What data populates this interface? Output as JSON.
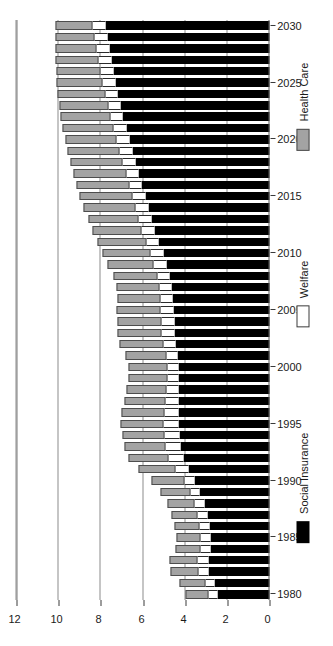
{
  "chart_data": {
    "type": "bar",
    "orientation": "rotated-90-ccw",
    "stacked": true,
    "title": "",
    "xlabel": "",
    "ylabel": "",
    "ylim": [
      0,
      12
    ],
    "ytick_values": [
      0,
      2,
      4,
      6,
      8,
      10,
      12
    ],
    "ytick_labels": [
      "0",
      "2",
      "4",
      "6",
      "8",
      "10",
      "12"
    ],
    "grid": true,
    "legend_position": "right",
    "categories": [
      "1980",
      "1981",
      "1982",
      "1983",
      "1984",
      "1985",
      "1986",
      "1987",
      "1988",
      "1989",
      "1990",
      "1991",
      "1992",
      "1993",
      "1994",
      "1995",
      "1996",
      "1997",
      "1998",
      "1999",
      "2000",
      "2001",
      "2002",
      "2003",
      "2004",
      "2005",
      "2006",
      "2007",
      "2008",
      "2009",
      "2010",
      "2011",
      "2012",
      "2013",
      "2014",
      "2015",
      "2016",
      "2017",
      "2018",
      "2019",
      "2020",
      "2021",
      "2022",
      "2023",
      "2024",
      "2025",
      "2026",
      "2027",
      "2028",
      "2029",
      "2030"
    ],
    "xtick_labels": [
      "1980",
      "1985",
      "1990",
      "1995",
      "2000",
      "2005",
      "2010",
      "2015",
      "2020",
      "2025",
      "2030"
    ],
    "series": [
      {
        "name": "Social Insurance",
        "color": "#000000",
        "values": [
          2.45,
          2.6,
          2.9,
          2.9,
          2.8,
          2.8,
          2.85,
          2.95,
          3.1,
          3.3,
          3.55,
          3.85,
          4.1,
          4.2,
          4.25,
          4.3,
          4.3,
          4.3,
          4.3,
          4.3,
          4.3,
          4.35,
          4.45,
          4.5,
          4.5,
          4.55,
          4.6,
          4.65,
          4.75,
          4.9,
          5.05,
          5.25,
          5.45,
          5.6,
          5.75,
          5.9,
          6.05,
          6.2,
          6.35,
          6.5,
          6.65,
          6.8,
          6.95,
          7.05,
          7.2,
          7.3,
          7.4,
          7.5,
          7.6,
          7.7,
          7.8
        ]
      },
      {
        "name": "Welfare",
        "color": "#ffffff",
        "values": [
          0.45,
          0.45,
          0.45,
          0.5,
          0.45,
          0.45,
          0.45,
          0.45,
          0.45,
          0.45,
          0.5,
          0.6,
          0.7,
          0.75,
          0.75,
          0.75,
          0.7,
          0.65,
          0.6,
          0.55,
          0.55,
          0.55,
          0.6,
          0.6,
          0.6,
          0.6,
          0.55,
          0.55,
          0.55,
          0.6,
          0.6,
          0.6,
          0.6,
          0.6,
          0.6,
          0.6,
          0.6,
          0.6,
          0.6,
          0.6,
          0.6,
          0.6,
          0.6,
          0.6,
          0.6,
          0.6,
          0.6,
          0.6,
          0.6,
          0.6,
          0.6
        ]
      },
      {
        "name": "Health Care",
        "color": "#a3a3a3",
        "values": [
          1.1,
          1.2,
          1.35,
          1.35,
          1.2,
          1.15,
          1.2,
          1.25,
          1.3,
          1.4,
          1.55,
          1.75,
          1.9,
          1.95,
          1.95,
          2.0,
          2.0,
          1.95,
          1.9,
          1.85,
          1.85,
          1.95,
          2.05,
          2.1,
          2.1,
          2.1,
          2.05,
          2.05,
          2.1,
          2.2,
          2.25,
          2.3,
          2.35,
          2.4,
          2.45,
          2.5,
          2.5,
          2.5,
          2.5,
          2.5,
          2.45,
          2.4,
          2.35,
          2.3,
          2.25,
          2.2,
          2.1,
          2.05,
          1.95,
          1.85,
          1.75
        ]
      }
    ]
  },
  "legend": {
    "items": [
      {
        "label": "Social Insurance",
        "swatch": "si"
      },
      {
        "label": "Welfare",
        "swatch": "wf"
      },
      {
        "label": "Health Care",
        "swatch": "hc"
      }
    ]
  },
  "colors": {
    "social_insurance": "#000000",
    "welfare": "#ffffff",
    "health_care": "#a3a3a3",
    "axis": "#3a3a3a",
    "grid": "#8c8c8c",
    "background": "#ffffff"
  }
}
